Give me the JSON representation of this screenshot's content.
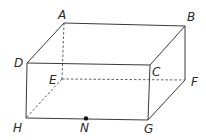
{
  "diagram": {
    "type": "rectangular-prism",
    "vertices": {
      "A": {
        "label": "A",
        "x": 64,
        "y": 23
      },
      "B": {
        "label": "B",
        "x": 185,
        "y": 26
      },
      "C": {
        "label": "C",
        "x": 150,
        "y": 65
      },
      "D": {
        "label": "D",
        "x": 27,
        "y": 63
      },
      "E": {
        "label": "E",
        "x": 62,
        "y": 79
      },
      "F": {
        "label": "F",
        "x": 185,
        "y": 80
      },
      "G": {
        "label": "G",
        "x": 148,
        "y": 120
      },
      "H": {
        "label": "H",
        "x": 26,
        "y": 118
      }
    },
    "point": {
      "label": "N",
      "x": 86,
      "y": 118
    },
    "visible_edges": [
      "AB",
      "AD",
      "BC",
      "DC",
      "BF",
      "FG",
      "CG",
      "DH",
      "HG"
    ],
    "hidden_edges": [
      "AE",
      "EF",
      "EH"
    ]
  }
}
